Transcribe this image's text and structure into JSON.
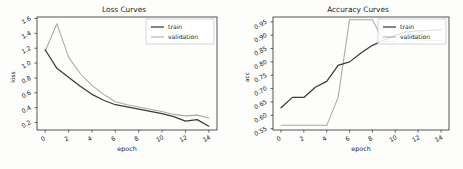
{
  "figure": {
    "background": "#fdfdfc",
    "panel_count": 2
  },
  "colors": {
    "train": "#3a3a3a",
    "validation": "#a9a9a9",
    "axis": "#2b2b2b",
    "text": "#1a1a1a"
  },
  "chart_data": [
    {
      "type": "line",
      "title": "Loss Curves",
      "xlabel": "epoch",
      "ylabel": "loss",
      "x": [
        0,
        1,
        2,
        3,
        4,
        5,
        6,
        7,
        8,
        9,
        10,
        11,
        12,
        13,
        14
      ],
      "xlim": [
        -0.7,
        14.7
      ],
      "ylim": [
        0.1,
        1.62
      ],
      "xticks": [
        0,
        2,
        4,
        6,
        8,
        10,
        12,
        14
      ],
      "xtick_labels": [
        "0",
        "2",
        "4",
        "6",
        "8",
        "10",
        "12",
        "14"
      ],
      "yticks": [
        0.2,
        0.4,
        0.6,
        0.8,
        1.0,
        1.2,
        1.4,
        1.6
      ],
      "ytick_labels": [
        "0.2",
        "0.4",
        "0.6",
        "0.8",
        "1.0",
        "1.2",
        "1.4",
        "1.6"
      ],
      "grid": false,
      "legend_position": "upper right",
      "series": [
        {
          "name": "train",
          "color": "#3a3a3a",
          "values": [
            1.18,
            0.93,
            0.81,
            0.69,
            0.58,
            0.5,
            0.44,
            0.41,
            0.38,
            0.35,
            0.32,
            0.28,
            0.22,
            0.24,
            0.15
          ]
        },
        {
          "name": "validation",
          "color": "#a9a9a9",
          "values": [
            1.16,
            1.53,
            1.08,
            0.86,
            0.7,
            0.58,
            0.48,
            0.44,
            0.41,
            0.38,
            0.35,
            0.31,
            0.29,
            0.3,
            0.26
          ]
        }
      ]
    },
    {
      "type": "line",
      "title": "Accuracy Curves",
      "xlabel": "epoch",
      "ylabel": "acc",
      "x": [
        0,
        1,
        2,
        3,
        4,
        5,
        6,
        7,
        8,
        9,
        10,
        11,
        12,
        13,
        14
      ],
      "xlim": [
        -0.7,
        14.7
      ],
      "ylim": [
        0.545,
        0.968
      ],
      "xticks": [
        0,
        2,
        4,
        6,
        8,
        10,
        12,
        14
      ],
      "xtick_labels": [
        "0",
        "2",
        "4",
        "6",
        "8",
        "10",
        "12",
        "14"
      ],
      "yticks": [
        0.55,
        0.6,
        0.65,
        0.7,
        0.75,
        0.8,
        0.85,
        0.9,
        0.95
      ],
      "ytick_labels": [
        "0.55",
        "0.60",
        "0.65",
        "0.70",
        "0.75",
        "0.80",
        "0.85",
        "0.90",
        "0.95"
      ],
      "grid": false,
      "legend_position": "upper right",
      "series": [
        {
          "name": "train",
          "color": "#3a3a3a",
          "values": [
            0.628,
            0.667,
            0.667,
            0.705,
            0.727,
            0.787,
            0.8,
            0.833,
            0.862,
            0.881,
            0.9,
            0.912,
            0.916,
            0.918,
            0.92
          ]
        },
        {
          "name": "validation",
          "color": "#a9a9a9",
          "values": [
            0.5625,
            0.5625,
            0.5625,
            0.5625,
            0.5625,
            0.667,
            0.958,
            0.958,
            0.958,
            0.875,
            0.875,
            0.917,
            0.88,
            0.88,
            0.88
          ]
        }
      ]
    }
  ],
  "legend": {
    "entries": [
      {
        "label": "train",
        "color": "#3a3a3a"
      },
      {
        "label": "validation",
        "color": "#a9a9a9"
      }
    ]
  }
}
